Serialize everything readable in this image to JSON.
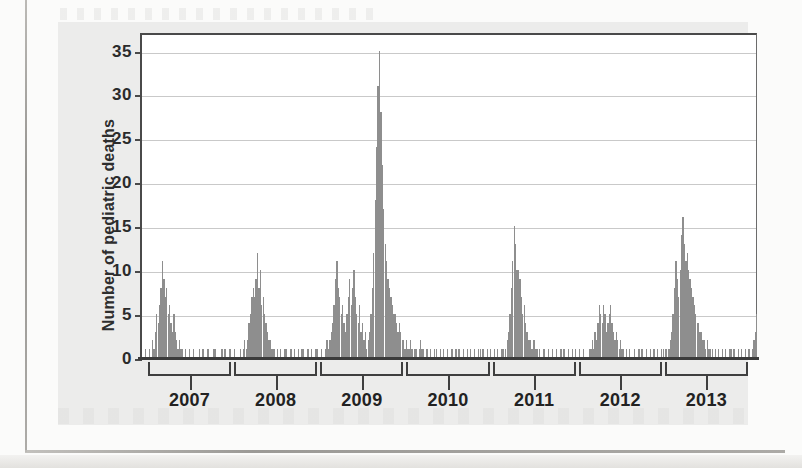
{
  "figure": {
    "kind": "surveillance-histogram",
    "panel_background": "#ececeb",
    "bar_color": "#8e8e8e",
    "axis_color": "#3f3f3f",
    "gridline_color": "#c9c9c9"
  },
  "chart_data": {
    "type": "bar",
    "title": "",
    "subtitle": "",
    "xlabel": "",
    "ylabel": "Number of pediatric deaths",
    "ylim": [
      0,
      37
    ],
    "yticks": [
      0,
      5,
      10,
      15,
      20,
      25,
      30,
      35
    ],
    "ytick_labels": [
      "0",
      "5",
      "10",
      "15",
      "20",
      "25",
      "30",
      "35"
    ],
    "grid": true,
    "legend": "none",
    "xtick_labels": [
      "2007",
      "2008",
      "2009",
      "2010",
      "2011",
      "2012",
      "2013"
    ],
    "x_axis_note": "Weekly counts; year brackets span each calendar year",
    "categories_description": "Week index from late 2006 through late 2013",
    "values": [
      0,
      0,
      1,
      0,
      0,
      1,
      0,
      2,
      1,
      3,
      5,
      4,
      6,
      8,
      11,
      9,
      7,
      8,
      5,
      6,
      4,
      3,
      5,
      3,
      2,
      1,
      2,
      1,
      1,
      0,
      1,
      0,
      0,
      1,
      0,
      0,
      1,
      0,
      0,
      0,
      1,
      0,
      1,
      1,
      0,
      0,
      1,
      0,
      0,
      0,
      1,
      1,
      0,
      0,
      0,
      0,
      1,
      0,
      1,
      0,
      0,
      1,
      1,
      0,
      0,
      1,
      0,
      0,
      0,
      1,
      0,
      1,
      2,
      1,
      2,
      4,
      5,
      7,
      8,
      7,
      9,
      12,
      8,
      10,
      6,
      7,
      5,
      4,
      3,
      2,
      2,
      1,
      1,
      1,
      0,
      1,
      0,
      1,
      0,
      0,
      1,
      1,
      0,
      0,
      1,
      1,
      0,
      1,
      0,
      0,
      1,
      0,
      1,
      1,
      0,
      0,
      1,
      1,
      0,
      1,
      0,
      0,
      1,
      1,
      0,
      0,
      1,
      0,
      0,
      1,
      2,
      1,
      2,
      3,
      4,
      6,
      9,
      11,
      8,
      7,
      5,
      6,
      4,
      3,
      5,
      7,
      9,
      6,
      8,
      10,
      7,
      5,
      4,
      6,
      3,
      4,
      2,
      3,
      1,
      2,
      3,
      5,
      8,
      12,
      18,
      24,
      31,
      35,
      28,
      22,
      17,
      13,
      11,
      9,
      8,
      7,
      6,
      5,
      5,
      4,
      3,
      4,
      3,
      2,
      2,
      1,
      2,
      1,
      1,
      2,
      1,
      0,
      1,
      1,
      0,
      1,
      2,
      1,
      1,
      0,
      1,
      1,
      0,
      1,
      0,
      0,
      1,
      1,
      0,
      0,
      1,
      0,
      1,
      0,
      0,
      1,
      0,
      0,
      1,
      0,
      0,
      1,
      0,
      1,
      0,
      0,
      1,
      0,
      0,
      1,
      0,
      1,
      0,
      0,
      1,
      0,
      0,
      1,
      1,
      0,
      1,
      0,
      0,
      1,
      0,
      1,
      0,
      0,
      1,
      0,
      1,
      0,
      0,
      1,
      1,
      0,
      1,
      2,
      3,
      5,
      8,
      11,
      15,
      13,
      10,
      10,
      9,
      7,
      5,
      6,
      4,
      3,
      2,
      2,
      1,
      1,
      2,
      1,
      1,
      0,
      1,
      0,
      0,
      1,
      0,
      0,
      1,
      0,
      0,
      1,
      0,
      0,
      1,
      0,
      0,
      1,
      0,
      1,
      0,
      0,
      1,
      0,
      0,
      1,
      0,
      1,
      0,
      0,
      1,
      0,
      0,
      1,
      0,
      0,
      0,
      1,
      1,
      2,
      1,
      3,
      2,
      4,
      6,
      5,
      4,
      6,
      5,
      3,
      4,
      5,
      6,
      4,
      3,
      2,
      3,
      2,
      1,
      2,
      1,
      1,
      0,
      1,
      0,
      1,
      0,
      0,
      0,
      1,
      0,
      0,
      1,
      0,
      1,
      0,
      0,
      1,
      0,
      0,
      1,
      0,
      1,
      1,
      0,
      1,
      0,
      0,
      1,
      1,
      0,
      1,
      0,
      1,
      2,
      3,
      5,
      8,
      11,
      9,
      7,
      10,
      14,
      16,
      13,
      11,
      12,
      10,
      9,
      8,
      7,
      6,
      5,
      4,
      4,
      3,
      3,
      2,
      2,
      1,
      2,
      1,
      1,
      0,
      1,
      0,
      1,
      0,
      1,
      0,
      0,
      1,
      0,
      1,
      0,
      0,
      1,
      1,
      0,
      1,
      0,
      0,
      1,
      0,
      1,
      0,
      0,
      1,
      0,
      1,
      1,
      0,
      1,
      2,
      3,
      5,
      0
    ],
    "notable_peaks": [
      {
        "label": "2006-07 season peak",
        "value": 11
      },
      {
        "label": "2007-08 season peak",
        "value": 12
      },
      {
        "label": "2009 H1N1 pandemic peak",
        "value": 35
      },
      {
        "label": "2010-11 season peak",
        "value": 15
      },
      {
        "label": "2011-12 season peak",
        "value": 6
      },
      {
        "label": "2012-13 season peak",
        "value": 16
      }
    ]
  },
  "yaxis": {
    "title": "Number of pediatric deaths"
  },
  "xaxis": {
    "years": [
      {
        "label": "2007"
      },
      {
        "label": "2008"
      },
      {
        "label": "2009"
      },
      {
        "label": "2010"
      },
      {
        "label": "2011"
      },
      {
        "label": "2012"
      },
      {
        "label": "2013"
      }
    ]
  }
}
